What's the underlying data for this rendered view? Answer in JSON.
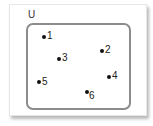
{
  "diagram": {
    "type": "venn",
    "universal_set_label": "U",
    "border_color": "#8c8c8c",
    "elements": [
      {
        "label": "1",
        "dot": [
          44,
          37
        ],
        "text": [
          47,
          31
        ]
      },
      {
        "label": "2",
        "dot": [
          102,
          51
        ],
        "text": [
          105,
          45
        ]
      },
      {
        "label": "3",
        "dot": [
          59,
          59
        ],
        "text": [
          62,
          53
        ]
      },
      {
        "label": "4",
        "dot": [
          109,
          77
        ],
        "text": [
          112,
          71
        ]
      },
      {
        "label": "5",
        "dot": [
          39,
          82
        ],
        "text": [
          42,
          77
        ]
      },
      {
        "label": "6",
        "dot": [
          87,
          92
        ],
        "text": [
          89,
          91
        ]
      }
    ]
  }
}
